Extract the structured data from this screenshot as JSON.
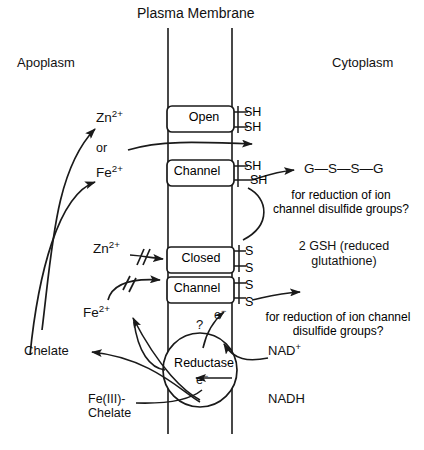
{
  "figure": {
    "title": "Plasma Membrane",
    "compartments": {
      "left": "Apoplasm",
      "right": "Cytoplasm"
    },
    "ions": {
      "zn_top": "Zn",
      "zn_top_charge": "2+",
      "or": "or",
      "fe_top": "Fe",
      "fe_top_charge": "2+",
      "zn_blocked": "Zn",
      "zn_blocked_charge": "2+",
      "fe_lower": "Fe",
      "fe_lower_charge": "2+"
    },
    "channels": {
      "open_line1": "Open",
      "open_line2": "Channel",
      "closed_line1": "Closed",
      "closed_line2": "Channel",
      "reductase": "Reductase"
    },
    "thiols": {
      "open_sh_1": "SH",
      "open_sh_2": "SH",
      "open_sh_3": "SH",
      "open_sh_4": "SH",
      "closed_s_1": "S",
      "closed_s_2": "S",
      "closed_s_3": "S",
      "closed_s_4": "S"
    },
    "glutathione": {
      "oxidized": "G—S—S—G",
      "reduced_line1": "2 GSH (reduced",
      "reduced_line2": "glutathione)"
    },
    "annotations": {
      "note_upper_line1": "for reduction of ion",
      "note_upper_line2": "channel disulfide groups?",
      "note_lower_line1": "for reduction of ion channel",
      "note_lower_line2": "disulfide groups?",
      "question_mark": "?"
    },
    "electrons": {
      "e_upper": "e",
      "e_upper_charge": "−",
      "e_inner": "e",
      "e_inner_charge": "−"
    },
    "cofactors": {
      "nad_plus": "NAD",
      "nad_plus_charge": "+",
      "nadh": "NADH"
    },
    "chelates": {
      "chelate": "Chelate",
      "fe3_chelate_line1": "Fe(III)-",
      "fe3_chelate_line2": "Chelate"
    },
    "colors": {
      "stroke": "#1a1a1a",
      "background": "#ffffff",
      "text": "#111111"
    }
  }
}
